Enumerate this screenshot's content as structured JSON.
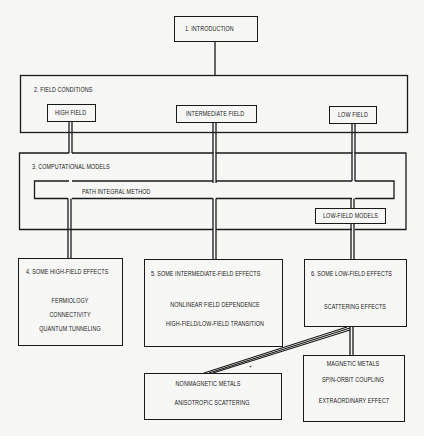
{
  "diagram": {
    "type": "flowchart",
    "nodes": {
      "introduction": {
        "label": "1.  INTRODUCTION"
      },
      "field_conditions": {
        "label": "2.  FIELD CONDITIONS",
        "children": {
          "high_field": "HIGH FIELD",
          "intermediate_field": "INTERMEDIATE FIELD",
          "low_field": "LOW FIELD"
        }
      },
      "computational_models": {
        "label": "3.  COMPUTATIONAL MODELS",
        "path_integral": "PATH INTEGRAL METHOD",
        "low_field_models": "LOW-FIELD MODELS"
      },
      "high_field_effects": {
        "label": "4.  SOME HIGH-FIELD EFFECTS",
        "items": [
          "FERMIOLOGY",
          "CONNECTIVITY",
          "QUANTUM TUNNELING"
        ]
      },
      "intermediate_field_effects": {
        "label": "5.  SOME INTERMEDIATE-FIELD EFFECTS",
        "items": [
          "NONLINEAR FIELD DEPENDENCE",
          "HIGH-FIELD/LOW-FIELD TRANSITION"
        ]
      },
      "low_field_effects": {
        "label": "6.  SOME LOW-FIELD EFFECTS",
        "items": [
          "SCATTERING EFFECTS"
        ]
      },
      "nonmagnetic_metals": {
        "items": [
          "NONMAGNETIC METALS",
          "ANISOTROPIC SCATTERING"
        ]
      },
      "magnetic_metals": {
        "items": [
          "MAGNETIC METALS",
          "SPIN-ORBIT COUPLING",
          "EXTRAORDINARY EFFECT"
        ]
      }
    },
    "marker": "+",
    "colors": {
      "line": "#1a1a1a",
      "background": "#f7f7f5"
    }
  }
}
